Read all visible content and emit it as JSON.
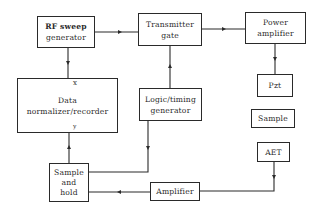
{
  "diagram": {
    "type": "block-diagram",
    "blocks": {
      "rf_sweep": {
        "lines": [
          "RF sweep",
          "generator"
        ]
      },
      "transmitter_gate": {
        "lines": [
          "Transmitter",
          "gate"
        ]
      },
      "power_amplifier": {
        "lines": [
          "Power",
          "amplifier"
        ]
      },
      "pzt": {
        "lines": [
          "Pzt"
        ]
      },
      "data_normalizer": {
        "lines": [
          "Data",
          "normalizer/recorder"
        ],
        "port_x": "x",
        "port_y": "y"
      },
      "logic_timing": {
        "lines": [
          "Logic/timing",
          "generator"
        ]
      },
      "sample": {
        "lines": [
          "Sample"
        ]
      },
      "aet": {
        "lines": [
          "AET"
        ]
      },
      "sample_hold": {
        "lines": [
          "Sample",
          "and",
          "hold"
        ]
      },
      "amplifier": {
        "lines": [
          "Amplifier"
        ]
      }
    },
    "connections": [
      {
        "from": "RF sweep generator",
        "to": "Transmitter gate"
      },
      {
        "from": "RF sweep generator",
        "to": "Data normalizer/recorder (x)"
      },
      {
        "from": "Transmitter gate",
        "to": "Power amplifier"
      },
      {
        "from": "Power amplifier",
        "to": "Pzt"
      },
      {
        "from": "Logic/timing generator",
        "to": "Transmitter gate"
      },
      {
        "from": "Logic/timing generator",
        "to": "Sample and hold"
      },
      {
        "from": "Sample and hold",
        "to": "Data normalizer/recorder (y)"
      },
      {
        "from": "AET",
        "to": "Amplifier"
      },
      {
        "from": "Amplifier",
        "to": "Sample and hold"
      }
    ]
  }
}
